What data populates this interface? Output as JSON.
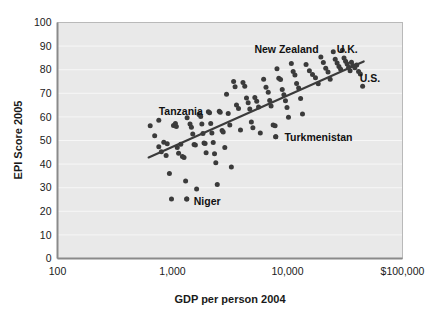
{
  "chart_data": {
    "type": "scatter",
    "title": "",
    "xlabel": "GDP per person 2004",
    "ylabel": "EPI Score 2005",
    "xscale": "log",
    "yscale": "linear",
    "xlim": [
      100,
      100000
    ],
    "ylim": [
      0,
      100
    ],
    "xticks": [
      100,
      1000,
      10000,
      100000
    ],
    "xtick_labels": [
      "100",
      "1,000",
      "10,000",
      "$100,000"
    ],
    "yticks": [
      0,
      10,
      20,
      30,
      40,
      50,
      60,
      70,
      80,
      90,
      100
    ],
    "ytick_labels": [
      "0",
      "10",
      "20",
      "30",
      "40",
      "50",
      "60",
      "70",
      "80",
      "90",
      "100"
    ],
    "grid": "horizontal",
    "legend": "none",
    "plot_background": "#e9e9e9",
    "point_color": "#3b3b3b",
    "trendline_color": "#3b3b3b",
    "trendline": {
      "x_start": 620,
      "y_start": 42.8,
      "x_end": 46000,
      "y_end": 83.5
    },
    "annotations": [
      {
        "text": "Tanzania",
        "x": 1180,
        "y": 62.5,
        "marker": false
      },
      {
        "text": "Niger",
        "x": 1530,
        "y": 24.3,
        "marker": true,
        "marker_x": 1330,
        "marker_y": 25.2
      },
      {
        "text": "New Zealand",
        "x": 9800,
        "y": 88.8,
        "marker": false
      },
      {
        "text": "U.K.",
        "x": 33000,
        "y": 88.8,
        "marker": false
      },
      {
        "text": "U.S.",
        "x": 52000,
        "y": 76.5,
        "marker": false
      },
      {
        "text": "Turkmenistan",
        "x": 9400,
        "y": 51.5,
        "marker": true,
        "marker_x": 7900,
        "marker_y": 51.6
      }
    ],
    "points": [
      {
        "x": 640,
        "y": 56.2
      },
      {
        "x": 760,
        "y": 58.6
      },
      {
        "x": 700,
        "y": 52.0
      },
      {
        "x": 760,
        "y": 47.4
      },
      {
        "x": 800,
        "y": 45.2
      },
      {
        "x": 840,
        "y": 49.3
      },
      {
        "x": 880,
        "y": 43.6
      },
      {
        "x": 900,
        "y": 48.6
      },
      {
        "x": 940,
        "y": 36.0
      },
      {
        "x": 980,
        "y": 25.2
      },
      {
        "x": 1020,
        "y": 56.4
      },
      {
        "x": 1060,
        "y": 57.2
      },
      {
        "x": 1080,
        "y": 55.9
      },
      {
        "x": 1100,
        "y": 47.0
      },
      {
        "x": 1130,
        "y": 44.6
      },
      {
        "x": 1180,
        "y": 48.4
      },
      {
        "x": 1220,
        "y": 43.2
      },
      {
        "x": 1260,
        "y": 42.8
      },
      {
        "x": 1300,
        "y": 32.8
      },
      {
        "x": 1340,
        "y": 59.6
      },
      {
        "x": 1420,
        "y": 57.0
      },
      {
        "x": 1460,
        "y": 55.6
      },
      {
        "x": 1500,
        "y": 52.8
      },
      {
        "x": 1540,
        "y": 48.3
      },
      {
        "x": 1580,
        "y": 48.1
      },
      {
        "x": 1620,
        "y": 29.5
      },
      {
        "x": 1700,
        "y": 61.0
      },
      {
        "x": 1760,
        "y": 60.2
      },
      {
        "x": 1800,
        "y": 57.0
      },
      {
        "x": 1840,
        "y": 53.0
      },
      {
        "x": 1880,
        "y": 48.9
      },
      {
        "x": 1920,
        "y": 48.7
      },
      {
        "x": 1960,
        "y": 44.8
      },
      {
        "x": 2050,
        "y": 62.2
      },
      {
        "x": 2100,
        "y": 61.8
      },
      {
        "x": 2150,
        "y": 57.2
      },
      {
        "x": 2200,
        "y": 53.2
      },
      {
        "x": 2260,
        "y": 49.2
      },
      {
        "x": 2320,
        "y": 44.4
      },
      {
        "x": 2380,
        "y": 40.6
      },
      {
        "x": 2450,
        "y": 31.4
      },
      {
        "x": 2550,
        "y": 62.4
      },
      {
        "x": 2600,
        "y": 62.0
      },
      {
        "x": 2700,
        "y": 54.2
      },
      {
        "x": 2760,
        "y": 53.6
      },
      {
        "x": 2850,
        "y": 47.0
      },
      {
        "x": 2950,
        "y": 69.6
      },
      {
        "x": 3050,
        "y": 61.4
      },
      {
        "x": 3150,
        "y": 56.6
      },
      {
        "x": 3250,
        "y": 38.8
      },
      {
        "x": 3400,
        "y": 75.0
      },
      {
        "x": 3500,
        "y": 72.8
      },
      {
        "x": 3600,
        "y": 65.0
      },
      {
        "x": 3750,
        "y": 63.6
      },
      {
        "x": 3900,
        "y": 54.4
      },
      {
        "x": 4100,
        "y": 74.6
      },
      {
        "x": 4250,
        "y": 73.0
      },
      {
        "x": 4400,
        "y": 68.0
      },
      {
        "x": 4550,
        "y": 66.0
      },
      {
        "x": 4700,
        "y": 63.4
      },
      {
        "x": 4850,
        "y": 57.8
      },
      {
        "x": 5000,
        "y": 55.4
      },
      {
        "x": 5200,
        "y": 68.2
      },
      {
        "x": 5400,
        "y": 66.6
      },
      {
        "x": 5600,
        "y": 64.2
      },
      {
        "x": 5800,
        "y": 53.2
      },
      {
        "x": 6200,
        "y": 76.0
      },
      {
        "x": 6500,
        "y": 72.6
      },
      {
        "x": 6800,
        "y": 70.4
      },
      {
        "x": 7000,
        "y": 67.0
      },
      {
        "x": 7200,
        "y": 64.6
      },
      {
        "x": 7500,
        "y": 56.6
      },
      {
        "x": 7800,
        "y": 56.2
      },
      {
        "x": 8100,
        "y": 80.4
      },
      {
        "x": 8400,
        "y": 76.4
      },
      {
        "x": 8700,
        "y": 75.8
      },
      {
        "x": 9000,
        "y": 71.6
      },
      {
        "x": 9300,
        "y": 69.4
      },
      {
        "x": 9600,
        "y": 66.8
      },
      {
        "x": 9900,
        "y": 64.0
      },
      {
        "x": 10200,
        "y": 59.8
      },
      {
        "x": 10800,
        "y": 82.6
      },
      {
        "x": 11200,
        "y": 79.2
      },
      {
        "x": 11600,
        "y": 77.8
      },
      {
        "x": 12000,
        "y": 74.2
      },
      {
        "x": 12500,
        "y": 72.2
      },
      {
        "x": 13000,
        "y": 67.8
      },
      {
        "x": 13500,
        "y": 61.2
      },
      {
        "x": 14500,
        "y": 82.2
      },
      {
        "x": 15500,
        "y": 79.6
      },
      {
        "x": 16500,
        "y": 78.0
      },
      {
        "x": 17500,
        "y": 76.6
      },
      {
        "x": 18500,
        "y": 74.0
      },
      {
        "x": 19500,
        "y": 85.4
      },
      {
        "x": 20500,
        "y": 83.0
      },
      {
        "x": 21500,
        "y": 80.6
      },
      {
        "x": 22500,
        "y": 79.0
      },
      {
        "x": 23500,
        "y": 76.0
      },
      {
        "x": 25000,
        "y": 87.6
      },
      {
        "x": 26000,
        "y": 84.4
      },
      {
        "x": 27000,
        "y": 82.8
      },
      {
        "x": 28000,
        "y": 81.4
      },
      {
        "x": 29000,
        "y": 80.2
      },
      {
        "x": 30000,
        "y": 88.2
      },
      {
        "x": 31000,
        "y": 85.0
      },
      {
        "x": 32000,
        "y": 83.6
      },
      {
        "x": 33000,
        "y": 82.4
      },
      {
        "x": 34000,
        "y": 81.0
      },
      {
        "x": 35000,
        "y": 79.6
      },
      {
        "x": 36000,
        "y": 83.2
      },
      {
        "x": 37000,
        "y": 81.8
      },
      {
        "x": 38500,
        "y": 80.8
      },
      {
        "x": 40000,
        "y": 82.0
      },
      {
        "x": 41500,
        "y": 79.2
      },
      {
        "x": 43000,
        "y": 78.2
      },
      {
        "x": 45000,
        "y": 73.0
      },
      {
        "x": 1330,
        "y": 25.2
      },
      {
        "x": 7900,
        "y": 51.6
      }
    ]
  }
}
